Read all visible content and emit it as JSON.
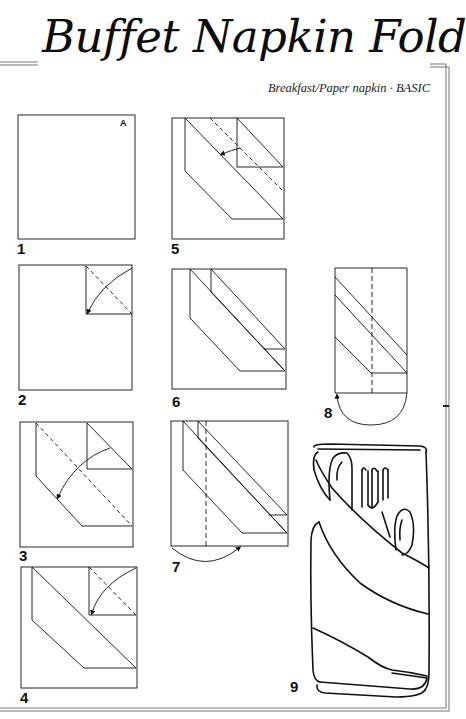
{
  "header": {
    "title": "Buffet Napkin Fold",
    "subtitle": "Breakfast/Paper napkin · BASIC"
  },
  "steps": [
    {
      "number": "1",
      "description": "Unfolded square napkin, corner A at top right",
      "corner_label": "A"
    },
    {
      "number": "2",
      "description": "Fold corner A diagonally to the center of the top-right quarter"
    },
    {
      "number": "3",
      "description": "Fold the top layer down diagonally"
    },
    {
      "number": "4",
      "description": "Fold the next corner down"
    },
    {
      "number": "5",
      "description": "Fold along the dashed line"
    },
    {
      "number": "6",
      "description": "Resulting diagonal bands"
    },
    {
      "number": "7",
      "description": "Fold the left side under along the dashed line"
    },
    {
      "number": "8",
      "description": "Fold the bottom under"
    },
    {
      "number": "9",
      "description": "Finished buffet napkin with knife, fork and spoon"
    }
  ],
  "colors": {
    "ink": "#111111",
    "frame": "#555555",
    "background": "#ffffff"
  }
}
